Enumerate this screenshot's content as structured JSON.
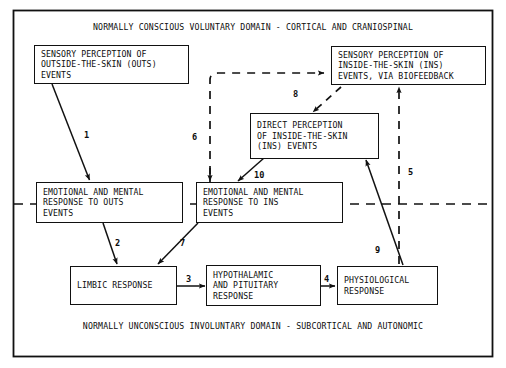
{
  "diagram": {
    "title_top": "NORMALLY CONSCIOUS VOLUNTARY DOMAIN - CORTICAL AND CRANIOSPINAL",
    "title_bottom": "NORMALLY UNCONSCIOUS INVOLUNTARY DOMAIN - SUBCORTICAL AND AUTONOMIC",
    "line_color": "#111111",
    "background": "#ffffff",
    "text_color": "#0d0d0d"
  },
  "nodes": [
    {
      "id": "sensory-outs",
      "lines": [
        "SENSORY PERCEPTION OF",
        "OUTSIDE-THE-SKIN (OUTS)",
        "EVENTS"
      ]
    },
    {
      "id": "sensory-ins-biofeedback",
      "lines": [
        "SENSORY PERCEPTION OF",
        "INSIDE-THE-SKIN (INS)",
        "EVENTS, VIA BIOFEEDBACK"
      ]
    },
    {
      "id": "direct-perception-ins",
      "lines": [
        "DIRECT PERCEPTION",
        "OF INSIDE-THE-SKIN",
        "(INS) EVENTS"
      ]
    },
    {
      "id": "emotional-mental-outs",
      "lines": [
        "EMOTIONAL AND MENTAL",
        "RESPONSE TO OUTS",
        "EVENTS"
      ]
    },
    {
      "id": "emotional-mental-ins",
      "lines": [
        "EMOTIONAL AND MENTAL",
        "RESPONSE TO INS",
        "EVENTS"
      ]
    },
    {
      "id": "limbic-response",
      "lines": [
        "LIMBIC RESPONSE"
      ]
    },
    {
      "id": "hypothalamic-pituitary",
      "lines": [
        "HYPOTHALAMIC",
        "AND PITUITARY",
        "RESPONSE"
      ]
    },
    {
      "id": "physiological-response",
      "lines": [
        "PHYSIOLOGICAL",
        "RESPONSE"
      ]
    }
  ],
  "edge_labels": [
    {
      "id": "1",
      "label": "1",
      "from": "sensory-outs",
      "to": "emotional-mental-outs",
      "style": "solid"
    },
    {
      "id": "2",
      "label": "2",
      "from": "emotional-mental-outs",
      "to": "limbic-response",
      "style": "solid"
    },
    {
      "id": "3",
      "label": "3",
      "from": "limbic-response",
      "to": "hypothalamic-pituitary",
      "style": "solid"
    },
    {
      "id": "4",
      "label": "4",
      "from": "hypothalamic-pituitary",
      "to": "physiological-response",
      "style": "solid"
    },
    {
      "id": "5",
      "label": "5",
      "from": "physiological-response",
      "to": "sensory-ins-biofeedback",
      "style": "dashed"
    },
    {
      "id": "6",
      "label": "6",
      "from": "emotional-mental-ins",
      "to": "sensory-ins-biofeedback",
      "style": "dashed"
    },
    {
      "id": "7",
      "label": "7",
      "from": "emotional-mental-ins",
      "to": "limbic-response",
      "style": "solid"
    },
    {
      "id": "8",
      "label": "8",
      "from": "sensory-ins-biofeedback",
      "to": "direct-perception-ins",
      "style": "dashed"
    },
    {
      "id": "9",
      "label": "9",
      "from": "physiological-response",
      "to": "direct-perception-ins",
      "style": "solid"
    },
    {
      "id": "10",
      "label": "10",
      "from": "direct-perception-ins",
      "to": "emotional-mental-ins",
      "style": "solid"
    }
  ]
}
